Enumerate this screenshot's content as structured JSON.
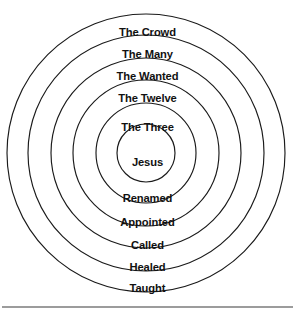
{
  "diagram": {
    "type": "concentric-circles",
    "background_color": "#ffffff",
    "stroke_color": "#1a1a1a",
    "text_color": "#111111",
    "center": {
      "x": 146,
      "y": 153
    },
    "baseline_rule": {
      "y": 307,
      "x1": 2,
      "x2": 293
    },
    "rings": [
      {
        "index": 0,
        "label": "The Crowd",
        "radius": 139,
        "upper_label_y": 26,
        "lower_label": "Taught",
        "lower_label_y": 282
      },
      {
        "index": 1,
        "label": "The Many",
        "radius": 118,
        "upper_label_y": 48,
        "lower_label": "Healed",
        "lower_label_y": 261
      },
      {
        "index": 2,
        "label": "The Wanted",
        "radius": 95,
        "upper_label_y": 70,
        "lower_label": "Called",
        "lower_label_y": 239
      },
      {
        "index": 3,
        "label": "The Twelve",
        "radius": 73,
        "upper_label_y": 92,
        "lower_label": "Appointed",
        "lower_label_y": 216
      },
      {
        "index": 4,
        "label": "The Three",
        "radius": 50,
        "upper_label_y": 121,
        "lower_label": "Renamed",
        "lower_label_y": 192
      },
      {
        "index": 5,
        "label": "Jesus",
        "radius": 29,
        "upper_label_y": 156,
        "lower_label": "",
        "lower_label_y": null
      }
    ],
    "outer_labels": [
      "The Crowd",
      "The Many",
      "The Wanted",
      "The Twelve",
      "The Three"
    ],
    "center_label": "Jesus",
    "action_labels": [
      "Renamed",
      "Appointed",
      "Called",
      "Healed",
      "Taught"
    ]
  }
}
